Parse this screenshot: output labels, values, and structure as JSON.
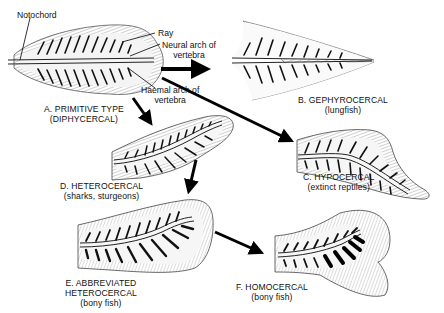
{
  "diagram": {
    "callouts": {
      "notochord": "Notochord",
      "ray": "Ray",
      "neural_arch_line1": "Neural arch of",
      "neural_arch_line2": "vertebra",
      "haemal_arch_line1": "Haemal arch of",
      "haemal_arch_line2": "vertebra"
    },
    "tails": [
      {
        "id": "A",
        "name": "A. PRIMITIVE TYPE",
        "sub": "(DIPHYCERCAL)"
      },
      {
        "id": "B",
        "name": "B. GEPHYROCERCAL",
        "sub": "(lungfish)"
      },
      {
        "id": "C",
        "name": "C. HYPOCERCAL",
        "sub": "(extinct reptiles)"
      },
      {
        "id": "D",
        "name": "D. HETEROCERCAL",
        "sub": "(sharks, sturgeons)"
      },
      {
        "id": "E",
        "name": "E. ABBREVIATED",
        "name2": "HETEROCERCAL",
        "sub": "(bony fish)"
      },
      {
        "id": "F",
        "name": "F. HOMOCERCAL",
        "sub": "(bony fish)"
      }
    ],
    "arrows": [
      {
        "from": "A",
        "to": "B"
      },
      {
        "from": "A",
        "to": "C"
      },
      {
        "from": "A",
        "to": "D"
      },
      {
        "from": "D",
        "to": "E"
      },
      {
        "from": "E",
        "to": "F"
      }
    ]
  }
}
